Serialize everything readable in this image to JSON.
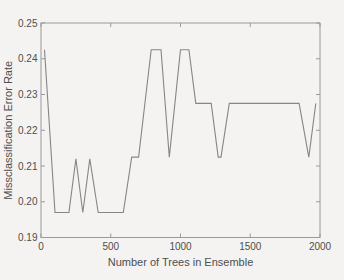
{
  "figure": {
    "background_color": "#f4f3f1",
    "line_color": "#868686",
    "spine_color": "#9a9a9a",
    "text_color": "#4e4e4e"
  },
  "chart_data": {
    "type": "line",
    "title": "",
    "xlabel": "Number of Trees in Ensemble",
    "ylabel": "Missclassification Error Rate",
    "xlim": [
      0,
      2000
    ],
    "ylim": [
      0.19,
      0.25
    ],
    "xticks": [
      0,
      500,
      1000,
      1500,
      2000
    ],
    "xticklabels": [
      "0",
      "500",
      "1000",
      "1500",
      "2000"
    ],
    "yticks": [
      0.19,
      0.2,
      0.21,
      0.22,
      0.23,
      0.24,
      0.25
    ],
    "yticklabels": [
      "0.19",
      "0.20",
      "0.21",
      "0.22",
      "0.23",
      "0.24",
      "0.25"
    ],
    "grid": false,
    "legend": "none",
    "box": true,
    "series": [
      {
        "name": "misclassification-error-rate",
        "points": [
          [
            25,
            0.2425
          ],
          [
            100,
            0.197
          ],
          [
            200,
            0.197
          ],
          [
            250,
            0.212
          ],
          [
            300,
            0.197
          ],
          [
            350,
            0.212
          ],
          [
            410,
            0.197
          ],
          [
            590,
            0.197
          ],
          [
            650,
            0.2125
          ],
          [
            700,
            0.2125
          ],
          [
            790,
            0.2425
          ],
          [
            860,
            0.2425
          ],
          [
            920,
            0.2125
          ],
          [
            1000,
            0.2425
          ],
          [
            1060,
            0.2425
          ],
          [
            1110,
            0.2275
          ],
          [
            1220,
            0.2275
          ],
          [
            1270,
            0.2125
          ],
          [
            1290,
            0.2125
          ],
          [
            1350,
            0.2275
          ],
          [
            1850,
            0.2275
          ],
          [
            1920,
            0.2125
          ],
          [
            1970,
            0.2275
          ]
        ]
      }
    ]
  }
}
